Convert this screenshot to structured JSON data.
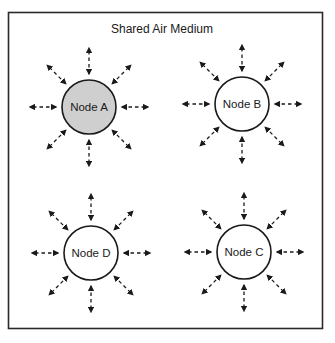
{
  "diagram": {
    "title": "Shared Air Medium",
    "colors": {
      "border": "#2a2a2a",
      "stroke": "#1a1a1a",
      "highlight_fill": "#cfcfcf",
      "normal_fill": "#ffffff"
    },
    "nodes": [
      {
        "id": "A",
        "label": "Node A",
        "cx": 89,
        "cy": 107,
        "highlighted": true
      },
      {
        "id": "B",
        "label": "Node B",
        "cx": 242,
        "cy": 104,
        "highlighted": false
      },
      {
        "id": "D",
        "label": "Node D",
        "cx": 91,
        "cy": 253,
        "highlighted": false
      },
      {
        "id": "C",
        "label": "Node C",
        "cx": 244,
        "cy": 252,
        "highlighted": false
      }
    ],
    "node_radius": 27,
    "arrow_inner_radius": 33,
    "arrow_outer_radius": 59,
    "arrow_directions_deg": [
      0,
      45,
      90,
      135,
      180,
      225,
      270,
      315
    ],
    "arrow_style": "dashed-bidirectional"
  }
}
